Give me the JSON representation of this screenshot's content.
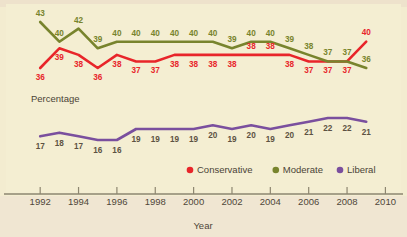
{
  "figure": {
    "background_color": "#f3ecd0",
    "panel_color": "#f4eed2",
    "y_axis_title": "Percentage",
    "x_axis_title": "Year"
  },
  "legend": {
    "position": "bottom-center",
    "items": [
      {
        "label": "Conservative",
        "color": "#e8252a",
        "marker": "circle"
      },
      {
        "label": "Moderate",
        "color": "#78842d",
        "marker": "circle"
      },
      {
        "label": "Liberal",
        "color": "#7a4f9e",
        "marker": "circle"
      }
    ]
  },
  "axis": {
    "year_ticks": [
      "1992",
      "1994",
      "1996",
      "1998",
      "2000",
      "2002",
      "2004",
      "2006",
      "2008",
      "2010"
    ],
    "year_tick_values": [
      1992,
      1994,
      1996,
      1998,
      2000,
      2002,
      2004,
      2006,
      2008,
      2010
    ],
    "x_min": 1991,
    "x_max": 2010.5
  },
  "chart_data": {
    "type": "line",
    "title": "",
    "subtitle": "",
    "xlabel": "Year",
    "ylabel": "Percentage",
    "grid": false,
    "legend_position": "bottom-center",
    "x": [
      1992,
      1993,
      1994,
      1995,
      1996,
      1997,
      1998,
      1999,
      2000,
      2001,
      2002,
      2003,
      2004,
      2005,
      2006,
      2007,
      2008,
      2009
    ],
    "xlim": [
      1991,
      2010.5
    ],
    "ylim": [
      14,
      45
    ],
    "series": [
      {
        "name": "Conservative",
        "color": "#e8252a",
        "values": [
          36,
          39,
          38,
          36,
          38,
          37,
          37,
          38,
          38,
          38,
          38,
          38,
          38,
          38,
          37,
          37,
          37,
          40
        ],
        "label_color": "#e8252a"
      },
      {
        "name": "Moderate",
        "color": "#78842d",
        "values": [
          43,
          40,
          42,
          39,
          40,
          40,
          40,
          40,
          40,
          40,
          39,
          40,
          40,
          39,
          38,
          37,
          37,
          36
        ],
        "label_color": "#78842d"
      },
      {
        "name": "Liberal",
        "color": "#7a4f9e",
        "values": [
          17,
          18,
          17,
          16,
          16,
          19,
          19,
          19,
          19,
          20,
          19,
          20,
          19,
          20,
          21,
          22,
          22,
          21
        ],
        "label_color": "#5d5242"
      }
    ]
  }
}
